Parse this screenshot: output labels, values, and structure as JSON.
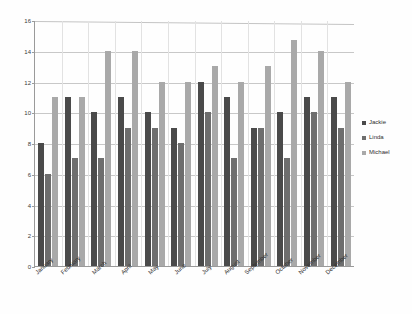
{
  "chart_data": {
    "type": "bar",
    "title": "",
    "subtitle": "",
    "xlabel": "",
    "ylabel": "",
    "ylim": [
      0,
      16
    ],
    "yticks": [
      0,
      2,
      4,
      6,
      8,
      10,
      12,
      14,
      16
    ],
    "grid": true,
    "legend_position": "right",
    "categories": [
      "January",
      "February",
      "March",
      "April",
      "May",
      "June",
      "July",
      "August",
      "September",
      "October",
      "November",
      "December"
    ],
    "series": [
      {
        "name": "Jackie",
        "color": "#4a4a4a",
        "values": [
          8,
          11,
          10,
          11,
          10,
          9,
          12,
          11,
          9,
          10,
          11,
          11
        ]
      },
      {
        "name": "Linda",
        "color": "#6e6e6e",
        "values": [
          6,
          7,
          7,
          9,
          9,
          8,
          10,
          7,
          9,
          7,
          10,
          9
        ]
      },
      {
        "name": "Michael",
        "color": "#a9a9a9",
        "values": [
          11,
          11,
          14,
          14,
          12,
          12,
          13,
          12,
          13,
          14.7,
          14,
          12
        ]
      }
    ]
  },
  "legend": {
    "items": [
      {
        "label": "Jackie",
        "swatch": "legend-swatch-jackie"
      },
      {
        "label": "Linda",
        "swatch": "legend-swatch-linda"
      },
      {
        "label": "Michael",
        "swatch": "legend-swatch-michael"
      }
    ]
  }
}
